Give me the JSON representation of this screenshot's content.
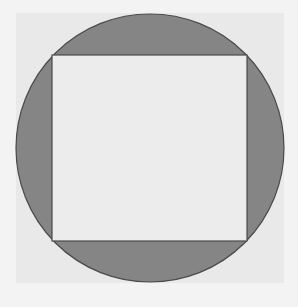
{
  "diagram": {
    "colors": {
      "page_background": "#f3f3f3",
      "backdrop_square": "#e9e9e9",
      "circle_fill": "#858585",
      "circle_stroke": "#4a4a4a",
      "square_fill": "#ececec",
      "square_stroke": "#4a4a4a"
    },
    "shapes": {
      "backdrop": {
        "x": 16,
        "y": 13,
        "w": 268,
        "h": 270
      },
      "circle": {
        "cx": 150,
        "cy": 148,
        "r": 134
      },
      "square": {
        "x": 52,
        "y": 55,
        "w": 195,
        "h": 186
      }
    }
  }
}
